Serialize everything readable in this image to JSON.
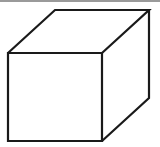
{
  "figure": {
    "type": "cube-line-drawing",
    "stroke_color": "#1a1a1a",
    "stroke_width": 2.2,
    "background": "#ffffff",
    "vertices": {
      "front_top_left": [
        8,
        53
      ],
      "front_top_right": [
        102,
        53
      ],
      "front_bottom_left": [
        8,
        141
      ],
      "front_bottom_right": [
        102,
        141
      ],
      "back_top_left": [
        55,
        10
      ],
      "back_top_right": [
        149,
        10
      ],
      "back_bottom_right": [
        149,
        98
      ]
    }
  }
}
